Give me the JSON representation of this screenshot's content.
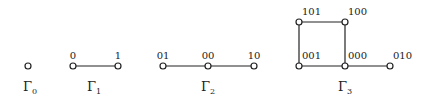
{
  "graphs": [
    {
      "name": "Γ",
      "sub": "0",
      "label_x": 30,
      "nodes": [
        {
          "id": "",
          "x": 28,
          "y": 66
        }
      ],
      "edges": []
    },
    {
      "name": "Γ",
      "sub": "1",
      "label_x": 94,
      "nodes": [
        {
          "id": "0",
          "x": 73,
          "y": 66
        },
        {
          "id": "1",
          "x": 118,
          "y": 66
        }
      ],
      "edges": [
        [
          0,
          1
        ]
      ]
    },
    {
      "name": "Γ",
      "sub": "2",
      "label_x": 208,
      "nodes": [
        {
          "id": "01",
          "x": 163,
          "y": 66
        },
        {
          "id": "00",
          "x": 208,
          "y": 66
        },
        {
          "id": "10",
          "x": 254,
          "y": 66
        }
      ],
      "edges": [
        [
          0,
          1
        ],
        [
          1,
          2
        ]
      ]
    },
    {
      "name": "Γ",
      "sub": "3",
      "label_x": 345,
      "nodes": [
        {
          "id": "101",
          "x": 299,
          "y": 22
        },
        {
          "id": "100",
          "x": 345,
          "y": 22
        },
        {
          "id": "001",
          "x": 299,
          "y": 66
        },
        {
          "id": "000",
          "x": 345,
          "y": 66
        },
        {
          "id": "010",
          "x": 390,
          "y": 66
        }
      ],
      "edges": [
        [
          0,
          1
        ],
        [
          0,
          2
        ],
        [
          1,
          3
        ],
        [
          2,
          3
        ],
        [
          3,
          4
        ]
      ]
    }
  ],
  "colors": {
    "stroke": "#222222",
    "fill": "#ffffff"
  }
}
